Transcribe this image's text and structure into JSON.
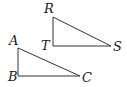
{
  "diagram": {
    "colors": {
      "stroke": "#333333",
      "text": "#1a1a1a",
      "background": "#ffffff"
    },
    "triangles": [
      {
        "name": "RTS",
        "vertices": {
          "R": {
            "label": "R",
            "x": 53,
            "y": 17
          },
          "T": {
            "label": "T",
            "x": 53,
            "y": 46
          },
          "S": {
            "label": "S",
            "x": 111,
            "y": 46
          }
        },
        "right_angle_at": "T"
      },
      {
        "name": "ABC",
        "vertices": {
          "A": {
            "label": "A",
            "x": 18,
            "y": 48
          },
          "B": {
            "label": "B",
            "x": 18,
            "y": 76
          },
          "C": {
            "label": "C",
            "x": 80,
            "y": 76
          }
        },
        "right_angle_at": "B"
      }
    ]
  }
}
